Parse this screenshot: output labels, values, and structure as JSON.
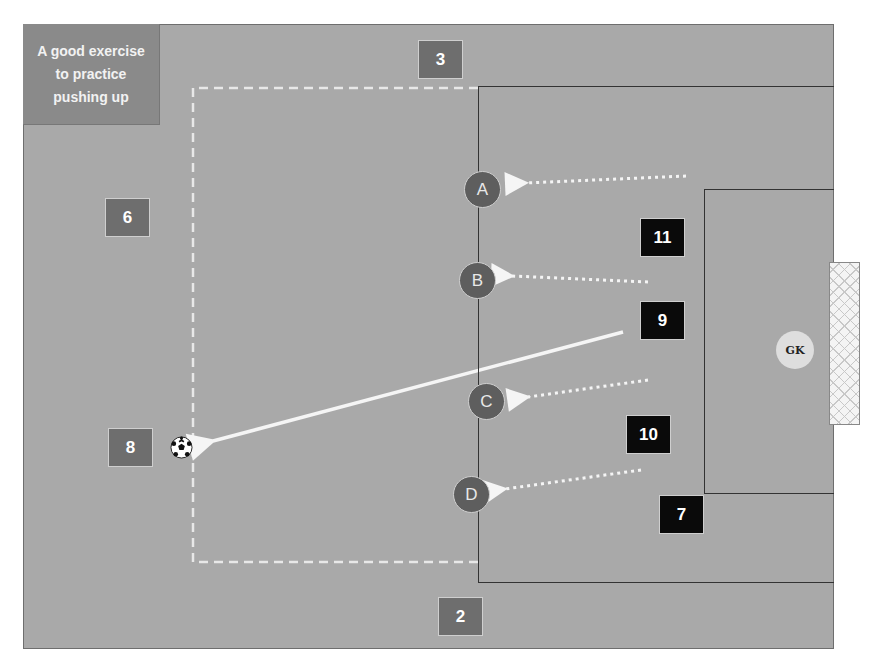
{
  "diagram": {
    "title_note": "A good exercise to practice pushing up",
    "colors": {
      "pitch": "#a9a9a9",
      "attacker_box": "#0a0a0a",
      "support_box": "#6e6e6e",
      "defender_circle": "#5e5e5e",
      "goalkeeper": "#dedede",
      "line_white": "#f5f5f5"
    },
    "support_players": [
      {
        "label": "3"
      },
      {
        "label": "6"
      },
      {
        "label": "8"
      },
      {
        "label": "2"
      }
    ],
    "attacking_players": [
      {
        "label": "11"
      },
      {
        "label": "9"
      },
      {
        "label": "10"
      },
      {
        "label": "7"
      }
    ],
    "defenders": [
      {
        "label": "A"
      },
      {
        "label": "B"
      },
      {
        "label": "C"
      },
      {
        "label": "D"
      }
    ],
    "goalkeeper": {
      "label": "GK"
    },
    "ball": {
      "icon": "soccer-ball-icon"
    },
    "arrows": [
      {
        "type": "dotted",
        "to": "A"
      },
      {
        "type": "dotted",
        "to": "B"
      },
      {
        "type": "dotted",
        "to": "C"
      },
      {
        "type": "dotted",
        "to": "D"
      },
      {
        "type": "solid-pass",
        "from": "9",
        "to": "8"
      }
    ]
  }
}
